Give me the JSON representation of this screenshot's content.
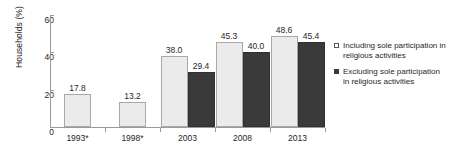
{
  "chart_data": {
    "type": "bar",
    "title": "",
    "xlabel": "",
    "ylabel": "Households (%)",
    "ylim": [
      0,
      60
    ],
    "yticks": [
      0,
      20,
      40,
      60
    ],
    "ytick_labels": [
      "0",
      "20",
      "40",
      "60"
    ],
    "grid": false,
    "legend_position": "right",
    "categories": [
      "1993*",
      "1998*",
      "2003",
      "2008",
      "2013"
    ],
    "series": [
      {
        "name": "Including sole participation in religious activities",
        "color": "#ebebeb",
        "values": [
          17.8,
          13.2,
          38.0,
          45.3,
          48.6
        ],
        "value_labels": [
          "17.8",
          "13.2",
          "38.0",
          "45.3",
          "48.6"
        ]
      },
      {
        "name": "Excluding sole participation in religious activities",
        "color": "#3a3a3a",
        "values": [
          null,
          null,
          29.4,
          40.0,
          45.4
        ],
        "value_labels": [
          "",
          "",
          "29.4",
          "40.0",
          "45.4"
        ]
      }
    ]
  },
  "legend": {
    "items": [
      {
        "label": "Including sole participation in religious activities",
        "marker": "open-square-swatch"
      },
      {
        "label": "Excluding sole participation in religious activities",
        "marker": "filled-square-swatch"
      }
    ]
  }
}
